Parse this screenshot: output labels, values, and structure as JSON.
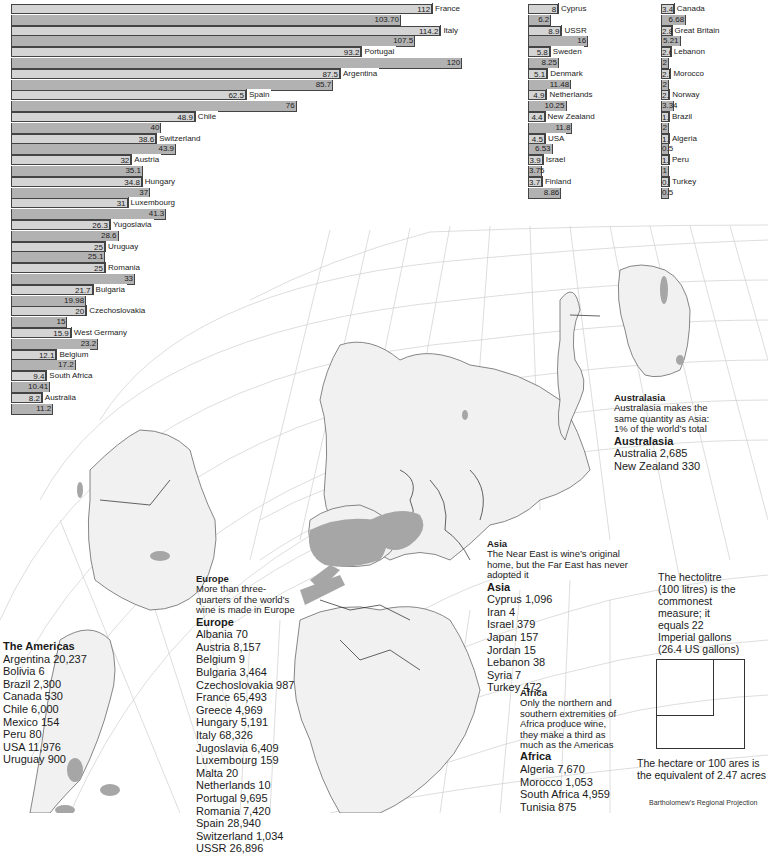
{
  "chart_data": {
    "type": "bar",
    "title": "",
    "orientation": "horizontal",
    "xlabel": "",
    "ylabel": "",
    "series_note": "Each country shows two bars: upper (light) and lower (dark)",
    "categories": [
      "France",
      "Italy",
      "Portugal",
      "Argentina",
      "Spain",
      "Chile",
      "Switzerland",
      "Austria",
      "Hungary",
      "Luxembourg",
      "Yugoslavia",
      "Uruguay",
      "Romania",
      "Bulgaria",
      "Czechoslovakia",
      "West Germany",
      "Belgium",
      "South Africa",
      "Australia",
      "Cyprus",
      "USSR",
      "Sweden",
      "Denmark",
      "Netherlands",
      "New Zealand",
      "USA",
      "Israel",
      "Finland",
      "Canada",
      "Great Britain",
      "Lebanon",
      "Morocco",
      "Norway",
      "Brazil",
      "Algeria",
      "Peru",
      "Turkey"
    ],
    "series": [
      {
        "name": "upper",
        "values": [
          112,
          114.2,
          93.2,
          87.5,
          62.5,
          48.9,
          38.6,
          32,
          34.8,
          31,
          26.3,
          25,
          25,
          21.7,
          20,
          15.9,
          12.1,
          9.4,
          8.2,
          8,
          8.9,
          5.8,
          5.1,
          4.9,
          4.4,
          4.5,
          3.9,
          3.7,
          3.4,
          2.8,
          2.6,
          2.5,
          2.2,
          1.7,
          1.5,
          1.1,
          0.9
        ]
      },
      {
        "name": "lower",
        "values": [
          103.7,
          107.5,
          120,
          85.7,
          76,
          40,
          43.9,
          35.1,
          37,
          41.3,
          28.6,
          25.1,
          33,
          19.98,
          15,
          23.2,
          17.2,
          10.41,
          11.2,
          6.2,
          16,
          8.25,
          11.48,
          10.25,
          11.8,
          6.53,
          3.75,
          8.86,
          6.68,
          5.21,
          2,
          2,
          3.34,
          2,
          0.5,
          1,
          0.5
        ]
      }
    ],
    "upper_labels": [
      "112",
      "114.2",
      "93.2",
      "87.5",
      "62.5",
      "48.9",
      "38.6",
      "32",
      "34.8",
      "31",
      "26.3",
      "25",
      "25",
      "21.7",
      "20",
      "15.9",
      "12.1",
      "9.4",
      "8.2",
      "8",
      "8.9",
      "5.8",
      "5.1",
      "4.9",
      "4.4",
      "4.5",
      "3.9",
      "3.7",
      "3.4",
      "2.8",
      "2.6",
      "2.5",
      "2.2",
      "1.7",
      "1.5",
      "1.1",
      "0.9"
    ],
    "lower_labels": [
      "103.70",
      "107.5",
      "120",
      "85.7",
      "76",
      "40",
      "43.9",
      "35.1",
      "37",
      "41.3",
      "28.6",
      "25.1",
      "33",
      "19.98",
      "15",
      "23.2",
      "17.2",
      "10.41",
      "11.2",
      "6.2",
      "16",
      "8.25",
      "11.48",
      "10.25",
      "11.8",
      "6.53",
      "3.75",
      "8.86",
      "6.68",
      "5.21",
      "2",
      "2",
      "3.34",
      "2",
      "0.5",
      "1",
      "0.5"
    ]
  },
  "charts": {
    "main": [
      {
        "country": "France",
        "a": 112,
        "a_label": "112",
        "b": 103.7,
        "b_label": "103.70"
      },
      {
        "country": "Italy",
        "a": 114.2,
        "a_label": "114.2",
        "b": 107.5,
        "b_label": "107.5"
      },
      {
        "country": "Portugal",
        "a": 93.2,
        "a_label": "93.2",
        "b": 120,
        "b_label": "120"
      },
      {
        "country": "Argentina",
        "a": 87.5,
        "a_label": "87.5",
        "b": 85.7,
        "b_label": "85.7"
      },
      {
        "country": "Spain",
        "a": 62.5,
        "a_label": "62.5",
        "b": 76,
        "b_label": "76"
      },
      {
        "country": "Chile",
        "a": 48.9,
        "a_label": "48.9",
        "b": 40,
        "b_label": "40"
      },
      {
        "country": "Switzerland",
        "a": 38.6,
        "a_label": "38.6",
        "b": 43.9,
        "b_label": "43.9"
      },
      {
        "country": "Austria",
        "a": 32,
        "a_label": "32",
        "b": 35.1,
        "b_label": "35.1"
      },
      {
        "country": "Hungary",
        "a": 34.8,
        "a_label": "34.8",
        "b": 37,
        "b_label": "37"
      },
      {
        "country": "Luxembourg",
        "a": 31,
        "a_label": "31",
        "b": 41.3,
        "b_label": "41.3"
      },
      {
        "country": "Yugoslavia",
        "a": 26.3,
        "a_label": "26.3",
        "b": 28.6,
        "b_label": "28.6"
      },
      {
        "country": "Uruguay",
        "a": 25,
        "a_label": "25",
        "b": 25.1,
        "b_label": "25.1"
      },
      {
        "country": "Romania",
        "a": 25,
        "a_label": "25",
        "b": 33,
        "b_label": "33"
      },
      {
        "country": "Bulgaria",
        "a": 21.7,
        "a_label": "21.7",
        "b": 19.98,
        "b_label": "19.98"
      },
      {
        "country": "Czechoslovakia",
        "a": 20,
        "a_label": "20",
        "b": 15,
        "b_label": "15"
      },
      {
        "country": "West Germany",
        "a": 15.9,
        "a_label": "15.9",
        "b": 23.2,
        "b_label": "23.2"
      },
      {
        "country": "Belgium",
        "a": 12.1,
        "a_label": "12.1",
        "b": 17.2,
        "b_label": "17.2"
      },
      {
        "country": "South Africa",
        "a": 9.4,
        "a_label": "9.4",
        "b": 10.41,
        "b_label": "10.41"
      },
      {
        "country": "Australia",
        "a": 8.2,
        "a_label": "8.2",
        "b": 11.2,
        "b_label": "11.2"
      }
    ],
    "mid": [
      {
        "country": "Cyprus",
        "a": 8,
        "a_label": "8",
        "b": 6.2,
        "b_label": "6.2"
      },
      {
        "country": "USSR",
        "a": 8.9,
        "a_label": "8.9",
        "b": 16,
        "b_label": "16"
      },
      {
        "country": "Sweden",
        "a": 5.8,
        "a_label": "5.8",
        "b": 8.25,
        "b_label": "8.25"
      },
      {
        "country": "Denmark",
        "a": 5.1,
        "a_label": "5.1",
        "b": 11.48,
        "b_label": "11.48"
      },
      {
        "country": "Netherlands",
        "a": 4.9,
        "a_label": "4.9",
        "b": 10.25,
        "b_label": "10.25"
      },
      {
        "country": "New Zealand",
        "a": 4.4,
        "a_label": "4.4",
        "b": 11.8,
        "b_label": "11.8"
      },
      {
        "country": "USA",
        "a": 4.5,
        "a_label": "4.5",
        "b": 6.53,
        "b_label": "6.53"
      },
      {
        "country": "Israel",
        "a": 3.9,
        "a_label": "3.9",
        "b": 3.75,
        "b_label": "3.75"
      },
      {
        "country": "Finland",
        "a": 3.7,
        "a_label": "3.7",
        "b": 8.86,
        "b_label": "8.86"
      }
    ],
    "right": [
      {
        "country": "Canada",
        "a": 3.4,
        "a_label": "3.4",
        "b": 6.68,
        "b_label": "6.68"
      },
      {
        "country": "Great Britain",
        "a": 2.8,
        "a_label": "2.8",
        "b": 5.21,
        "b_label": "5.21"
      },
      {
        "country": "Lebanon",
        "a": 2.6,
        "a_label": "2.6",
        "b": 2,
        "b_label": "2"
      },
      {
        "country": "Morocco",
        "a": 2.5,
        "a_label": "2.5",
        "b": 2,
        "b_label": "2"
      },
      {
        "country": "Norway",
        "a": 2.2,
        "a_label": "2.2",
        "b": 3.34,
        "b_label": "3.34"
      },
      {
        "country": "Brazil",
        "a": 1.7,
        "a_label": "1.7",
        "b": 2,
        "b_label": "2"
      },
      {
        "country": "Algeria",
        "a": 1.5,
        "a_label": "1.5",
        "b": 0.5,
        "b_label": "0.5"
      },
      {
        "country": "Peru",
        "a": 1.1,
        "a_label": "1.1",
        "b": 1,
        "b_label": "1"
      },
      {
        "country": "Turkey",
        "a": 0.9,
        "a_label": "0.9",
        "b": 0.5,
        "b_label": "0.5"
      }
    ]
  },
  "colors": {
    "bar_upper": "#d4d4d4",
    "bar_lower": "#b2b2b2",
    "land": "#ececec",
    "vineyard": "#a6a6a6",
    "grid": "#c8c8c8"
  },
  "regions": {
    "australasia": {
      "heading": "Australasia",
      "note": [
        "Australasia makes the",
        "same quantity as Asia:",
        "1% of the world’s total"
      ],
      "title": "Australasia",
      "items": [
        "Australia 2,685",
        "New Zealand 330"
      ]
    },
    "asia": {
      "heading": "Asia",
      "note": [
        "The Near East is wine’s original",
        "home, but the Far East has never",
        "adopted it"
      ],
      "title": "Asia",
      "items": [
        "Cyprus 1,096",
        "Iran 4",
        "Israel 379",
        "Japan 157",
        "Jordan 15",
        "Lebanon 38",
        "Syria 7",
        "Turkey 472"
      ]
    },
    "africa": {
      "heading": "Africa",
      "note": [
        "Only the northern and",
        "southern extremities of",
        "Africa produce wine,",
        "they make a third as",
        "much as the Americas"
      ],
      "title": "Africa",
      "items": [
        "Algeria 7,670",
        "Morocco 1,053",
        "South Africa 4,959",
        "Tunisia 875"
      ]
    },
    "europe": {
      "heading": "Europe",
      "note": [
        "More than three-",
        "quarters of the world’s",
        "wine is made in Europe"
      ],
      "title": "Europe",
      "items": [
        "Albania 70",
        "Austria 8,157",
        "Belgium 9",
        "Bulgaria 3,464",
        "Czechoslovakia 987",
        "France 65,493",
        "Greece 4,969",
        "Hungary 5,191",
        "Italy 68,326",
        "Jugoslavia 6,409",
        "Luxembourg 159",
        "Malta 20",
        "Netherlands 10",
        "Portugal 9,695",
        "Romania 7,420",
        "Spain 28,940",
        "Switzerland 1,034",
        "USSR 26,896"
      ]
    },
    "americas": {
      "title": "The Americas",
      "items": [
        "Argentina 20,237",
        "Bolivia 6",
        "Brazil 2,300",
        "Canada 530",
        "Chile 6,000",
        "Mexico 154",
        "Peru 80",
        "USA 11,976",
        "Uruguay 900"
      ]
    }
  },
  "hectolitre_note": [
    "The hectolitre",
    "(100 litres) is the",
    "commonest",
    "measure; it",
    "equals 22",
    "Imperial gallons",
    "(26.4 US gallons)"
  ],
  "hectare_note": [
    "The hectare or 100 ares is",
    "the equivalent of 2.47 acres"
  ],
  "credit": "Bartholomew’s Regional Projection"
}
